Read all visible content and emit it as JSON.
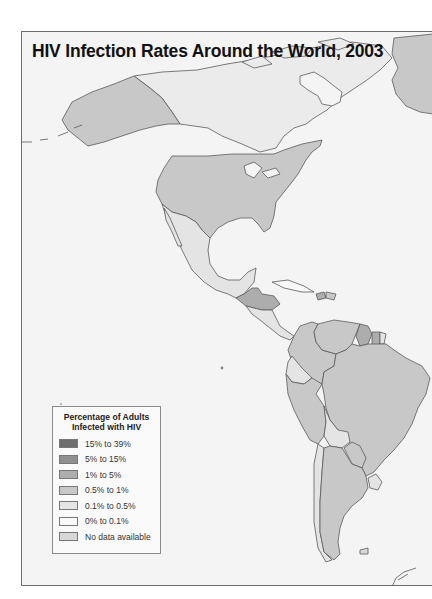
{
  "map": {
    "title": "HIV Infection Rates Around the World, 2003",
    "region_shown": "The Americas",
    "colors": {
      "ocean": "#f4f4f4",
      "border": "#5a5a5a"
    }
  },
  "legend": {
    "title_line1": "Percentage of Adults",
    "title_line2": "Infected with HIV",
    "items": [
      {
        "label": "15% to 39%",
        "color": "#6e6e6e"
      },
      {
        "label": "5% to 15%",
        "color": "#909090"
      },
      {
        "label": "1% to 5%",
        "color": "#adadad"
      },
      {
        "label": "0.5% to 1%",
        "color": "#c8c8c8"
      },
      {
        "label": "0.1% to 0.5%",
        "color": "#e4e4e4"
      },
      {
        "label": "0% to 0.1%",
        "color": "#f9f9f9"
      },
      {
        "label": "No data available",
        "color": "#d8d8d8"
      }
    ]
  },
  "regions": [
    {
      "name": "Alaska",
      "category": "0.5% to 1%"
    },
    {
      "name": "Canada",
      "category": "0.1% to 0.5%"
    },
    {
      "name": "Greenland",
      "category": "0.5% to 1%"
    },
    {
      "name": "United States",
      "category": "0.5% to 1%"
    },
    {
      "name": "Mexico",
      "category": "0.1% to 0.5%"
    },
    {
      "name": "Guatemala",
      "category": "1% to 5%"
    },
    {
      "name": "Honduras",
      "category": "1% to 5%"
    },
    {
      "name": "Belize",
      "category": "1% to 5%"
    },
    {
      "name": "Haiti",
      "category": "1% to 5%"
    },
    {
      "name": "Cuba",
      "category": "0% to 0.1%"
    },
    {
      "name": "Venezuela",
      "category": "0.5% to 1%"
    },
    {
      "name": "Colombia",
      "category": "0.5% to 1%"
    },
    {
      "name": "Guyana",
      "category": "1% to 5%"
    },
    {
      "name": "Suriname",
      "category": "1% to 5%"
    },
    {
      "name": "Ecuador",
      "category": "0.1% to 0.5%"
    },
    {
      "name": "Peru",
      "category": "0.5% to 1%"
    },
    {
      "name": "Brazil",
      "category": "0.5% to 1%"
    },
    {
      "name": "Bolivia",
      "category": "0.1% to 0.5%"
    },
    {
      "name": "Paraguay",
      "category": "0.5% to 1%"
    },
    {
      "name": "Uruguay",
      "category": "0.1% to 0.5%"
    },
    {
      "name": "Argentina",
      "category": "0.5% to 1%"
    },
    {
      "name": "Chile",
      "category": "0.1% to 0.5%"
    }
  ]
}
